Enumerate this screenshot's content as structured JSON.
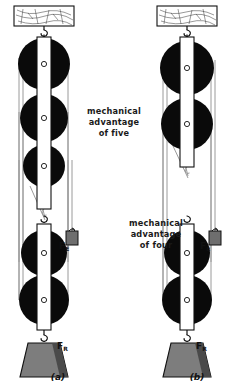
{
  "figure": {
    "panels": [
      {
        "id": "a",
        "caption": "(a)",
        "ma_label_line1": "mechanical",
        "ma_label_line2": "advantage",
        "ma_label_line3": "of five",
        "mechanical_advantage": 5,
        "supporting_strands": 5,
        "fixed_block_pulleys": 3,
        "movable_block_pulleys": 2,
        "effort_force_label": "F",
        "effort_force_subscript": "E",
        "resistance_force_label": "F",
        "resistance_force_subscript": "R",
        "ceiling_mount": "wood-grain-beam"
      },
      {
        "id": "b",
        "caption": "(b)",
        "ma_label_line1": "mechanical",
        "ma_label_line2": "advantage",
        "ma_label_line3": "of four",
        "mechanical_advantage": 4,
        "supporting_strands": 4,
        "fixed_block_pulleys": 2,
        "movable_block_pulleys": 2,
        "effort_force_label": "F",
        "effort_force_subscript": "E",
        "resistance_force_label": "F",
        "resistance_force_subscript": "R",
        "ceiling_mount": "wood-grain-beam"
      }
    ],
    "colors": {
      "pulley_wheel": "#0a0a0a",
      "block_frame": "#ffffff",
      "rope": "#8a8a8a",
      "load_block": "#7d7d7d",
      "load_block_shade": "#4a4a4a",
      "effort_weight": "#6e6e6e",
      "outline": "#111111",
      "background": "#ffffff"
    }
  }
}
